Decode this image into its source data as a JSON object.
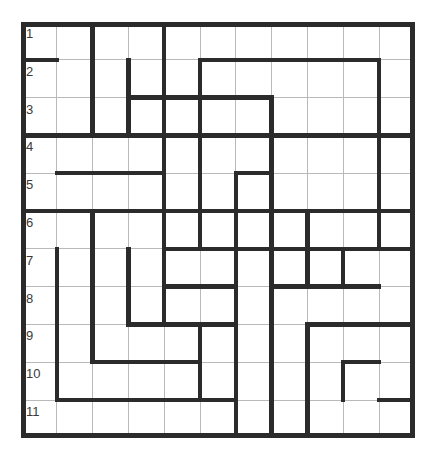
{
  "puzzle": {
    "title": "Grid Puzzle",
    "type": "wall-grid",
    "rows": 11,
    "cols": 11,
    "origin": {
      "x": 21,
      "y": 22
    },
    "cell_width": 35.8,
    "cell_height": 37.8,
    "colors": {
      "background": "#ffffff",
      "thin_line": "#b9b9b9",
      "thick_wall": "#2b2b2b",
      "border": "#2b2b2b",
      "number_text": "#3a3a3a"
    },
    "line_widths": {
      "thin": 1,
      "thick": 4.5,
      "border": 5
    },
    "row_labels": [
      "1",
      "2",
      "3",
      "4",
      "5",
      "6",
      "7",
      "8",
      "9",
      "10",
      "11"
    ],
    "row_label_column": 1,
    "walls": {
      "horizontal": [
        {
          "row": 1,
          "col_start": 0,
          "col_end": 1
        },
        {
          "row": 3,
          "col_start": 1,
          "col_end": 3
        },
        {
          "row": 3,
          "col_start": 0,
          "col_end": 11
        },
        {
          "row": 2,
          "col_start": 3,
          "col_end": 7
        },
        {
          "row": 1,
          "col_start": 5,
          "col_end": 10
        },
        {
          "row": 3,
          "col_start": 5,
          "col_end": 8
        },
        {
          "row": 4,
          "col_start": 1,
          "col_end": 4
        },
        {
          "row": 4,
          "col_start": 6,
          "col_end": 7
        },
        {
          "row": 5,
          "col_start": 0,
          "col_end": 11
        },
        {
          "row": 5,
          "col_start": 4,
          "col_end": 6
        },
        {
          "row": 6,
          "col_start": 4,
          "col_end": 11
        },
        {
          "row": 7,
          "col_start": 4,
          "col_end": 6
        },
        {
          "row": 7,
          "col_start": 7,
          "col_end": 10
        },
        {
          "row": 8,
          "col_start": 3,
          "col_end": 6
        },
        {
          "row": 8,
          "col_start": 8,
          "col_end": 11
        },
        {
          "row": 9,
          "col_start": 2,
          "col_end": 5
        },
        {
          "row": 9,
          "col_start": 9,
          "col_end": 10
        },
        {
          "row": 10,
          "col_start": 1,
          "col_end": 6
        },
        {
          "row": 10,
          "col_start": 10,
          "col_end": 11
        },
        {
          "row": 6,
          "col_start": 6,
          "col_end": 8
        }
      ],
      "vertical": [
        {
          "col": 2,
          "row_start": 0,
          "row_end": 3
        },
        {
          "col": 4,
          "row_start": 0,
          "row_end": 6
        },
        {
          "col": 3,
          "row_start": 1,
          "row_end": 3
        },
        {
          "col": 5,
          "row_start": 1,
          "row_end": 6
        },
        {
          "col": 7,
          "row_start": 2,
          "row_end": 5
        },
        {
          "col": 10,
          "row_start": 1,
          "row_end": 6
        },
        {
          "col": 6,
          "row_start": 4,
          "row_end": 6
        },
        {
          "col": 2,
          "row_start": 5,
          "row_end": 9
        },
        {
          "col": 4,
          "row_start": 5,
          "row_end": 8
        },
        {
          "col": 1,
          "row_start": 6,
          "row_end": 10
        },
        {
          "col": 3,
          "row_start": 6,
          "row_end": 8
        },
        {
          "col": 6,
          "row_start": 6,
          "row_end": 11
        },
        {
          "col": 7,
          "row_start": 5,
          "row_end": 11
        },
        {
          "col": 8,
          "row_start": 5,
          "row_end": 7
        },
        {
          "col": 9,
          "row_start": 6,
          "row_end": 7
        },
        {
          "col": 8,
          "row_start": 8,
          "row_end": 11
        },
        {
          "col": 9,
          "row_start": 9,
          "row_end": 10
        },
        {
          "col": 5,
          "row_start": 8,
          "row_end": 10
        }
      ]
    }
  }
}
